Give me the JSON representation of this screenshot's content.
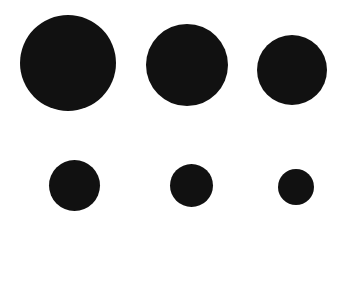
{
  "background": "#ffffff",
  "circle_color": "#111111",
  "rows": [
    {
      "circles": [
        {
          "cx": 68,
          "cy": 63,
          "d": 96
        },
        {
          "cx": 187,
          "cy": 65,
          "d": 82
        },
        {
          "cx": 292,
          "cy": 70,
          "d": 70
        }
      ]
    },
    {
      "circles": [
        {
          "cx": 74,
          "cy": 185,
          "d": 51
        },
        {
          "cx": 191,
          "cy": 185,
          "d": 43
        },
        {
          "cx": 296,
          "cy": 187,
          "d": 36
        }
      ]
    }
  ]
}
